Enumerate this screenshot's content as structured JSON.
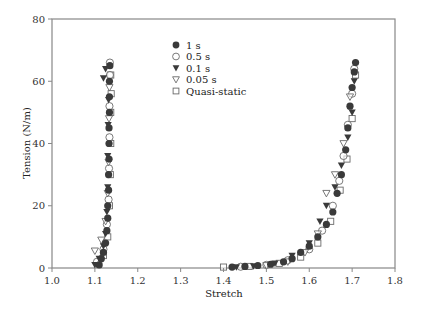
{
  "chart_data": {
    "type": "scatter",
    "title": "",
    "xlabel": "Stretch",
    "ylabel": "Tension (N/m)",
    "xlim": [
      1.0,
      1.8
    ],
    "ylim": [
      0,
      80
    ],
    "xticks": [
      1.0,
      1.1,
      1.2,
      1.3,
      1.4,
      1.5,
      1.6,
      1.7,
      1.8
    ],
    "xtick_labels": [
      "1.0",
      "1.1",
      "1.2",
      "1.3",
      "1.4",
      "1.5",
      "1.6",
      "1.7",
      "1.8"
    ],
    "yticks": [
      0,
      20,
      40,
      60,
      80
    ],
    "ytick_labels": [
      "0",
      "20",
      "40",
      "60",
      "80"
    ],
    "grid": false,
    "legend_position": "upper center (inside plot)",
    "colors": {
      "filled": "#3a3a3a",
      "open_stroke": "#6a6a6a",
      "axis": "#888888"
    },
    "series": [
      {
        "name": "1 s",
        "marker": "filled-circle",
        "points": [
          [
            1.11,
            1
          ],
          [
            1.115,
            3
          ],
          [
            1.12,
            5
          ],
          [
            1.125,
            8
          ],
          [
            1.128,
            12
          ],
          [
            1.13,
            16
          ],
          [
            1.13,
            20
          ],
          [
            1.132,
            25
          ],
          [
            1.132,
            30
          ],
          [
            1.133,
            35
          ],
          [
            1.133,
            40
          ],
          [
            1.133,
            45
          ],
          [
            1.134,
            50
          ],
          [
            1.134,
            55
          ],
          [
            1.134,
            60
          ],
          [
            1.135,
            65
          ],
          [
            1.42,
            0.3
          ],
          [
            1.45,
            0.5
          ],
          [
            1.48,
            0.8
          ],
          [
            1.51,
            1.2
          ],
          [
            1.54,
            2
          ],
          [
            1.56,
            3
          ],
          [
            1.58,
            5
          ],
          [
            1.6,
            7
          ],
          [
            1.62,
            10
          ],
          [
            1.64,
            14
          ],
          [
            1.655,
            18
          ],
          [
            1.665,
            24
          ],
          [
            1.675,
            30
          ],
          [
            1.685,
            38
          ],
          [
            1.69,
            45
          ],
          [
            1.695,
            52
          ],
          [
            1.7,
            58
          ],
          [
            1.705,
            63
          ],
          [
            1.708,
            66
          ]
        ]
      },
      {
        "name": "0.5 s",
        "marker": "open-circle",
        "points": [
          [
            1.105,
            2
          ],
          [
            1.12,
            6
          ],
          [
            1.128,
            14
          ],
          [
            1.132,
            22
          ],
          [
            1.133,
            32
          ],
          [
            1.134,
            42
          ],
          [
            1.134,
            52
          ],
          [
            1.135,
            62
          ],
          [
            1.135,
            66
          ],
          [
            1.44,
            0.4
          ],
          [
            1.5,
            1
          ],
          [
            1.55,
            2.5
          ],
          [
            1.6,
            6
          ],
          [
            1.63,
            12
          ],
          [
            1.655,
            20
          ],
          [
            1.67,
            28
          ],
          [
            1.68,
            36
          ],
          [
            1.69,
            46
          ],
          [
            1.7,
            56
          ],
          [
            1.705,
            64
          ]
        ]
      },
      {
        "name": "0.1 s",
        "marker": "filled-triangle-down",
        "points": [
          [
            1.1,
            1
          ],
          [
            1.11,
            3
          ],
          [
            1.12,
            7
          ],
          [
            1.125,
            11
          ],
          [
            1.128,
            18
          ],
          [
            1.13,
            26
          ],
          [
            1.13,
            36
          ],
          [
            1.131,
            46
          ],
          [
            1.132,
            54
          ],
          [
            1.12,
            61
          ],
          [
            1.125,
            64
          ],
          [
            1.43,
            0.3
          ],
          [
            1.47,
            0.6
          ],
          [
            1.52,
            1.5
          ],
          [
            1.56,
            4
          ],
          [
            1.6,
            8
          ],
          [
            1.625,
            15
          ],
          [
            1.64,
            20
          ],
          [
            1.66,
            26
          ],
          [
            1.675,
            33
          ],
          [
            1.69,
            42
          ],
          [
            1.7,
            50
          ],
          [
            1.705,
            60
          ]
        ]
      },
      {
        "name": "0.05 s",
        "marker": "open-triangle-down",
        "points": [
          [
            1.1,
            5.5
          ],
          [
            1.115,
            9
          ],
          [
            1.125,
            15
          ],
          [
            1.13,
            24
          ],
          [
            1.132,
            34
          ],
          [
            1.133,
            48
          ],
          [
            1.134,
            58
          ],
          [
            1.5,
            0.8
          ],
          [
            1.55,
            2
          ],
          [
            1.59,
            5
          ],
          [
            1.62,
            11
          ],
          [
            1.64,
            24
          ],
          [
            1.66,
            30
          ],
          [
            1.68,
            40
          ],
          [
            1.695,
            55
          ]
        ]
      },
      {
        "name": "Quasi-static",
        "marker": "open-square",
        "points": [
          [
            1.12,
            4
          ],
          [
            1.13,
            10
          ],
          [
            1.134,
            20
          ],
          [
            1.136,
            30
          ],
          [
            1.137,
            40
          ],
          [
            1.137,
            50
          ],
          [
            1.138,
            56
          ],
          [
            1.137,
            62
          ],
          [
            1.4,
            0.3
          ],
          [
            1.46,
            0.5
          ],
          [
            1.53,
            1.5
          ],
          [
            1.58,
            3.5
          ],
          [
            1.62,
            8
          ],
          [
            1.65,
            15
          ],
          [
            1.672,
            25
          ],
          [
            1.688,
            35
          ],
          [
            1.7,
            48
          ],
          [
            1.708,
            62
          ]
        ]
      }
    ]
  }
}
